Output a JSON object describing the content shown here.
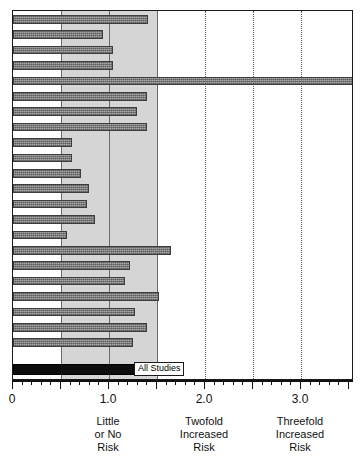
{
  "chart_data": {
    "type": "bar",
    "title": "",
    "subtitle": "",
    "xlabel": "",
    "ylabel": "",
    "orientation": "horizontal",
    "xlim": [
      0,
      3.55
    ],
    "grid": true,
    "legend": null,
    "shaded_band": {
      "from": 0.5,
      "to": 1.5,
      "meaning": "Little or No Risk"
    },
    "gridline_values": [
      0.5,
      1.0,
      1.5,
      2.0,
      2.5,
      3.0
    ],
    "tick_labels": [
      "0",
      "1.0",
      "2.0",
      "3.0"
    ],
    "tick_values": [
      0,
      1.0,
      2.0,
      3.0
    ],
    "minor_tick_step": 0.1,
    "categories": [
      "Study 1",
      "Study 2",
      "Study 3",
      "Study 4",
      "Study 5",
      "Study 6",
      "Study 7",
      "Study 8",
      "Study 9",
      "Study 10",
      "Study 11",
      "Study 12",
      "Study 13",
      "Study 14",
      "Study 15",
      "Study 16",
      "Study 17",
      "Study 18",
      "Study 19",
      "Study 20",
      "Study 21",
      "Study 22"
    ],
    "values": [
      1.41,
      0.94,
      1.04,
      1.04,
      3.55,
      1.4,
      1.29,
      1.4,
      0.61,
      0.61,
      0.71,
      0.79,
      0.77,
      0.85,
      0.56,
      1.65,
      1.22,
      1.17,
      1.52,
      1.27,
      1.4,
      1.25
    ],
    "summary": {
      "label": "All Studies",
      "value": 1.27
    },
    "annotations": [
      {
        "at": 1.0,
        "text": "Little or No Risk"
      },
      {
        "at": 2.0,
        "text": "Twofold Increased Risk"
      },
      {
        "at": 3.0,
        "text": "Threefold Increased Risk"
      }
    ],
    "colors": {
      "bar": "#8a8a8a",
      "bar_border": "#3d3d3d",
      "summary_bar": "#0d0d0d",
      "band": "#d5d5d5",
      "frame": "#1a1a1a",
      "gridline": "#555555",
      "background": "#ffffff"
    }
  },
  "axis": {
    "labels": [
      {
        "value": 0,
        "text": "0"
      },
      {
        "value": 1.0,
        "text": "1.0"
      },
      {
        "value": 2.0,
        "text": "2.0"
      },
      {
        "value": 3.0,
        "text": "3.0"
      }
    ],
    "zones": [
      {
        "at": 1.0,
        "line1": "Little",
        "line2": "or No",
        "line3": "Risk"
      },
      {
        "at": 2.0,
        "line1": "Twofold",
        "line2": "Increased",
        "line3": "Risk"
      },
      {
        "at": 3.0,
        "line1": "Threefold",
        "line2": "Increased",
        "line3": "Risk"
      }
    ]
  },
  "summary_label": {
    "text": "All Studies"
  }
}
